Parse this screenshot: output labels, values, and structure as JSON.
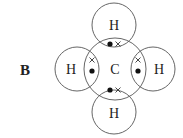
{
  "label": "B",
  "molecule": {
    "central_atom": {
      "symbol": "C",
      "cx": 115,
      "cy": 69,
      "r": 31
    },
    "outer_atoms": [
      {
        "symbol": "H",
        "position": "top",
        "cx": 114,
        "cy": 25,
        "r": 22
      },
      {
        "symbol": "H",
        "position": "left",
        "cx": 77,
        "cy": 69,
        "r": 22
      },
      {
        "symbol": "H",
        "position": "right",
        "cx": 153,
        "cy": 69,
        "r": 22
      },
      {
        "symbol": "H",
        "position": "bottom",
        "cx": 114,
        "cy": 112,
        "r": 22
      }
    ],
    "bond_electrons": [
      {
        "position": "top",
        "dot": [
          110,
          44
        ],
        "cross": [
          118,
          44
        ]
      },
      {
        "position": "left",
        "cross": [
          92,
          60
        ],
        "dot": [
          92,
          71
        ]
      },
      {
        "position": "right",
        "cross": [
          138,
          60
        ],
        "dot": [
          138,
          71
        ]
      },
      {
        "position": "bottom",
        "dot": [
          110,
          90
        ],
        "cross": [
          118,
          90
        ]
      }
    ]
  },
  "colors": {
    "stroke": "#555555",
    "text": "#222222"
  }
}
